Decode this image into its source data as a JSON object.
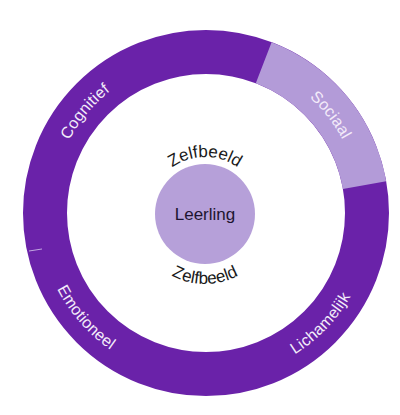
{
  "diagram": {
    "center": {
      "label": "Leerling",
      "color": "#b6a0d9"
    },
    "self_image": {
      "top_label": "Zelfbeeld",
      "bottom_label": "Zelfbeeld"
    },
    "ring": {
      "base_color": "#6a22a9",
      "highlight_color": "#b39bd8",
      "segments": [
        {
          "label": "Cognitief",
          "color": "#6a22a9"
        },
        {
          "label": "Sociaal",
          "color": "#b39bd8"
        },
        {
          "label": "Lichamelijk",
          "color": "#6a22a9"
        },
        {
          "label": "Emotioneel",
          "color": "#6a22a9"
        }
      ]
    }
  }
}
